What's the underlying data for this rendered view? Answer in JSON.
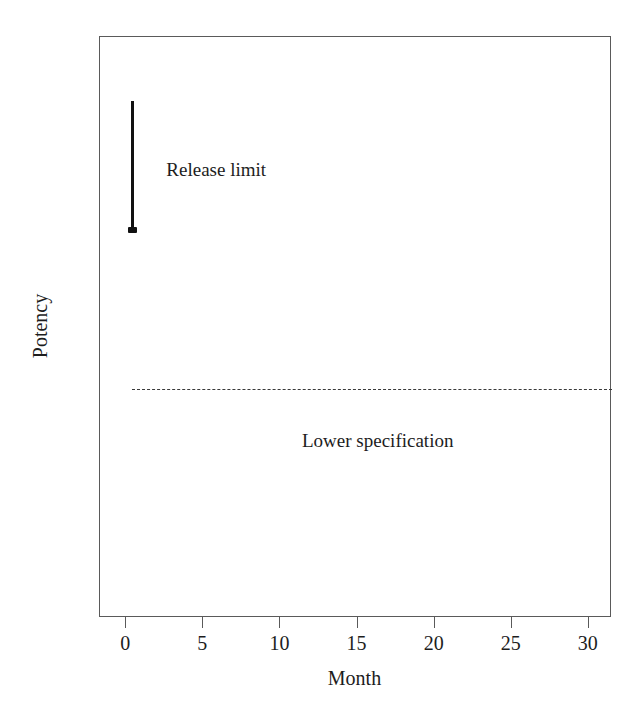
{
  "chart_data": {
    "type": "line",
    "title": "",
    "subtitle": "",
    "xlabel": "Month",
    "ylabel": "Potency",
    "xlim": [
      -1.7,
      31.5
    ],
    "ylim": [
      0,
      100
    ],
    "grid": false,
    "legend_position": "none",
    "x_ticks": [
      {
        "value": 0,
        "label": "0"
      },
      {
        "value": 5,
        "label": "5"
      },
      {
        "value": 10,
        "label": "10"
      },
      {
        "value": 15,
        "label": "15"
      },
      {
        "value": 20,
        "label": "20"
      },
      {
        "value": 25,
        "label": "25"
      },
      {
        "value": 30,
        "label": "30"
      }
    ],
    "y_ticks": [],
    "series": [
      {
        "name": "Release limit",
        "type": "vertical-interval-bar",
        "style": "solid",
        "color": "#111111",
        "x": 0.4,
        "y_top": 88.9,
        "y_bottom": 66.5,
        "marker_at": "bottom"
      },
      {
        "name": "Lower specification",
        "type": "horizontal-reference-line",
        "style": "dashed",
        "color": "#3a3a3a",
        "y": 39.4,
        "x_from": 0.4,
        "x_to": 31.5
      }
    ],
    "annotations": [
      {
        "text": "Release limit",
        "x": 2.6,
        "y": 78.8
      },
      {
        "text": "Lower specification",
        "x": 11.4,
        "y": 32.2
      }
    ]
  },
  "axes": {
    "x_title": "Month",
    "y_title": "Potency"
  },
  "annotations": {
    "release_limit": "Release limit",
    "lower_specification": "Lower specification"
  },
  "colors": {
    "background": "#ffffff",
    "frame": "#5a5a5a",
    "release_limit": "#111111",
    "lower_specification": "#3a3a3a",
    "text": "#1d1d1d"
  }
}
